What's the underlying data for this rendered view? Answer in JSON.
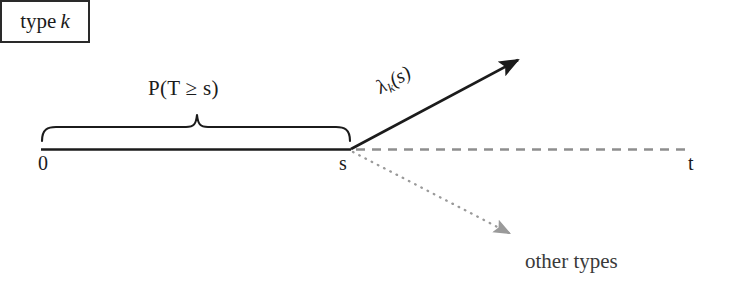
{
  "figure": {
    "background_color": "#ffffff"
  },
  "labels": {
    "survival_probability": {
      "text": "P(T ≥ s)",
      "parts": {
        "prefix": "P(",
        "variable": "T",
        "operator": "≥",
        "argument": "s",
        "suffix": ")"
      }
    },
    "rate": {
      "text": "λk(s)",
      "parts": {
        "lambda": "λ",
        "subscript": "k",
        "argument": "(s)"
      }
    },
    "type_k": {
      "text": "type k",
      "prefix": "type",
      "variable": "k"
    },
    "origin": "0",
    "s_point": "s",
    "t_point": "t",
    "other_types": "other types"
  },
  "axis": {
    "start_label": "0",
    "event_label": "s",
    "end_label": "t",
    "observed_segment": {
      "from": "0",
      "to": "s",
      "style": "solid"
    },
    "future_segment": {
      "from": "s",
      "to": "t",
      "style": "dashed"
    }
  },
  "transitions": [
    {
      "name": "type-k-transition",
      "label": "λk(s)",
      "target": "type k",
      "style": "solid",
      "color": "#1b1b1b"
    },
    {
      "name": "other-types-transition",
      "label": "other types",
      "target": "other types",
      "style": "dotted",
      "color": "#8c8c8c"
    }
  ],
  "brace": {
    "label": "P(T ≥ s)",
    "spans": {
      "from": "0",
      "to": "s"
    }
  },
  "colors": {
    "ink": "#1b1b1b",
    "dashed_line": "#8e8e8e",
    "dotted_line": "#9a9a9a",
    "box_border": "#2a2a2a",
    "other_types_text": "#3a3a3a"
  }
}
